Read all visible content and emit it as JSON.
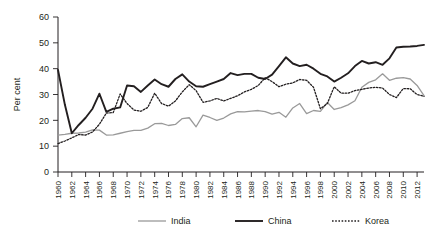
{
  "chart_data": {
    "type": "line",
    "title": "",
    "xlabel": "",
    "ylabel": "Per cent",
    "ylim": [
      0,
      60
    ],
    "yticks": [
      0,
      10,
      20,
      30,
      40,
      50,
      60
    ],
    "xlim": [
      1960,
      2013
    ],
    "xticks": [
      1960,
      1962,
      1964,
      1966,
      1968,
      1970,
      1972,
      1974,
      1976,
      1978,
      1980,
      1982,
      1984,
      1986,
      1988,
      1990,
      1992,
      1994,
      1996,
      1998,
      2000,
      2002,
      2004,
      2006,
      2008,
      2010,
      2012
    ],
    "grid": false,
    "legend_position": "bottom",
    "x": [
      1960,
      1961,
      1962,
      1963,
      1964,
      1965,
      1966,
      1967,
      1968,
      1969,
      1970,
      1971,
      1972,
      1973,
      1974,
      1975,
      1976,
      1977,
      1978,
      1979,
      1980,
      1981,
      1982,
      1983,
      1984,
      1985,
      1986,
      1987,
      1988,
      1989,
      1990,
      1991,
      1992,
      1993,
      1994,
      1995,
      1996,
      1997,
      1998,
      1999,
      2000,
      2001,
      2002,
      2003,
      2004,
      2005,
      2006,
      2007,
      2008,
      2009,
      2010,
      2011,
      2012,
      2013
    ],
    "series": [
      {
        "name": "India",
        "color": "#9a9a9a",
        "style": "solid",
        "width": 1.3,
        "values": [
          14.3,
          14.6,
          15.0,
          15.1,
          15.4,
          16.3,
          16.2,
          14.3,
          14.4,
          15.0,
          15.6,
          16.1,
          16.1,
          17.0,
          18.7,
          18.8,
          18.0,
          18.4,
          20.7,
          21.0,
          17.5,
          22.0,
          21.1,
          20.0,
          20.9,
          22.5,
          23.4,
          23.3,
          23.6,
          23.8,
          23.4,
          22.4,
          23.1,
          21.2,
          24.8,
          26.5,
          22.6,
          23.8,
          23.5,
          26.9,
          24.2,
          24.9,
          26.0,
          27.6,
          32.8,
          34.7,
          35.7,
          38.0,
          35.5,
          36.3,
          36.5,
          36.0,
          33.5,
          29.6
        ]
      },
      {
        "name": "China",
        "color": "#231f20",
        "style": "solid",
        "width": 1.9,
        "values": [
          39.5,
          26.0,
          15.0,
          18.2,
          21.0,
          24.5,
          30.3,
          23.3,
          24.5,
          25.0,
          33.5,
          33.2,
          31.0,
          33.5,
          35.8,
          34.0,
          33.0,
          36.0,
          37.8,
          35.0,
          33.2,
          33.0,
          34.0,
          35.0,
          36.0,
          38.3,
          37.5,
          38.0,
          38.0,
          36.5,
          36.0,
          37.7,
          41.0,
          44.4,
          42.0,
          41.0,
          41.5,
          40.0,
          38.0,
          37.0,
          35.0,
          36.5,
          38.2,
          41.0,
          43.0,
          42.0,
          42.5,
          41.5,
          44.0,
          48.2,
          48.5,
          48.6,
          48.8,
          49.2
        ]
      },
      {
        "name": "Korea",
        "color": "#231f20",
        "style": "dotted",
        "width": 1.3,
        "values": [
          11.0,
          12.0,
          13.2,
          14.5,
          14.3,
          15.5,
          18.5,
          22.8,
          23.0,
          30.2,
          26.5,
          24.0,
          23.5,
          25.0,
          30.5,
          26.5,
          25.5,
          27.5,
          31.0,
          33.8,
          31.5,
          27.0,
          27.5,
          28.5,
          27.5,
          28.5,
          29.5,
          31.0,
          32.0,
          33.5,
          36.5,
          35.0,
          33.0,
          34.0,
          34.5,
          35.8,
          35.5,
          32.8,
          24.5,
          26.5,
          33.0,
          30.5,
          30.5,
          31.5,
          32.0,
          32.5,
          32.8,
          32.5,
          30.0,
          28.8,
          32.3,
          32.2,
          30.0,
          29.3
        ]
      }
    ]
  },
  "legend": {
    "items": [
      {
        "label": "India"
      },
      {
        "label": "China"
      },
      {
        "label": "Korea"
      }
    ]
  }
}
